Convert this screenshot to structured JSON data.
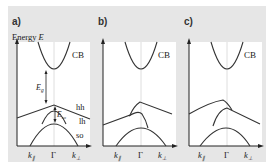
{
  "figure": {
    "y_axis_label": "Energy",
    "y_axis_symbol": "E",
    "panels": [
      {
        "id": "a",
        "label": "a)",
        "band_labels": [
          "CB",
          "hh",
          "lh",
          "so"
        ],
        "annotations": [
          "E_g",
          "E_so"
        ],
        "x_ticks": [
          "k∥",
          "Γ",
          "k⊥"
        ]
      },
      {
        "id": "b",
        "label": "b)",
        "band_labels": [
          "CB"
        ],
        "x_ticks": [
          "k∥",
          "Γ",
          "k⊥"
        ]
      },
      {
        "id": "c",
        "label": "c)",
        "band_labels": [
          "CB"
        ],
        "x_ticks": [
          "k∥",
          "Γ",
          "k⊥"
        ]
      }
    ]
  },
  "labels": {
    "a": "a)",
    "b": "b)",
    "c": "c)",
    "energy": "Energy ",
    "energy_sym": "E",
    "cb": "CB",
    "hh": "hh",
    "lh": "lh",
    "so": "so",
    "eg_main": "E",
    "eg_sub": "g",
    "eso_main": "E",
    "eso_sub": "so",
    "k_par": "k",
    "k_par_sub": "∥",
    "gamma": "Γ",
    "k_perp": "k",
    "k_perp_sub": "⊥"
  },
  "colors": {
    "frame_bg": "#e6e6e6",
    "plot_bg": "#ffffff",
    "curve": "#333333",
    "gridline": "#d0d0d0"
  }
}
